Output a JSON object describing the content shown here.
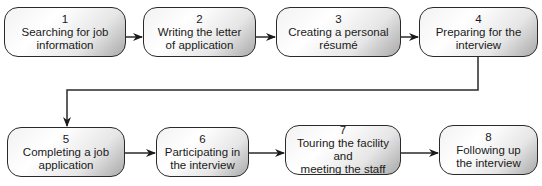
{
  "diagram": {
    "type": "flowchart",
    "steps": [
      {
        "number": "1",
        "line1": "Searching for job",
        "line2": "information"
      },
      {
        "number": "2",
        "line1": "Writing the letter",
        "line2": "of application"
      },
      {
        "number": "3",
        "line1": "Creating a personal",
        "line2": "résumé"
      },
      {
        "number": "4",
        "line1": "Preparing for the",
        "line2": "interview"
      },
      {
        "number": "5",
        "line1": "Completing a job",
        "line2": "application"
      },
      {
        "number": "6",
        "line1": "Participating in",
        "line2": "the interview"
      },
      {
        "number": "7",
        "line1": "Touring the facility and",
        "line2": "meeting the staff"
      },
      {
        "number": "8",
        "line1": "Following up",
        "line2": "the interview"
      }
    ],
    "colors": {
      "stroke": "#2a2a2a",
      "fill_light": "#ffffff",
      "fill_dark": "#a9a9a9"
    }
  }
}
